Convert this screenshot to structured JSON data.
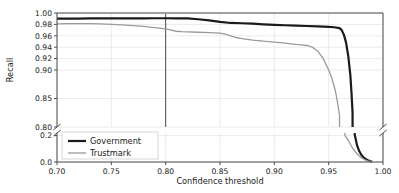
{
  "chart_data": {
    "type": "line",
    "title": "",
    "xlabel": "Confidence threshold",
    "ylabel": "Recall",
    "xlim": [
      0.7,
      1.0
    ],
    "xticks": [
      0.7,
      0.75,
      0.8,
      0.85,
      0.9,
      0.95,
      1.0
    ],
    "xticklabels": [
      "0.70",
      "0.75",
      "0.80",
      "0.85",
      "0.90",
      "0.95",
      "1.00"
    ],
    "yticklabels_upper": [
      "1.00",
      "0.98",
      "0.96",
      "0.94",
      "0.92",
      "0.90",
      "0.85",
      "0.80"
    ],
    "yticks_upper": [
      1.0,
      0.98,
      0.96,
      0.94,
      0.92,
      0.9,
      0.85,
      0.8
    ],
    "yticklabels_lower": [
      "0.2",
      "0.0"
    ],
    "yticks_lower": [
      0.2,
      0.0
    ],
    "broken_axis": true,
    "broken_axis_note": "y-axis broken between 0.80 and 0.2",
    "grid": true,
    "legend_position": "lower left",
    "annotation_vline_x": 0.8,
    "series": [
      {
        "name": "Government",
        "color": "#1a1a1a",
        "linewidth": 2.2,
        "x": [
          0.7,
          0.71,
          0.72,
          0.73,
          0.74,
          0.75,
          0.76,
          0.77,
          0.78,
          0.79,
          0.8,
          0.81,
          0.82,
          0.83,
          0.84,
          0.85,
          0.86,
          0.87,
          0.88,
          0.89,
          0.9,
          0.91,
          0.92,
          0.93,
          0.94,
          0.95,
          0.955,
          0.96,
          0.962,
          0.964,
          0.966,
          0.968,
          0.97,
          0.971,
          0.972,
          0.973,
          0.974,
          0.975,
          0.976,
          0.978,
          0.98,
          0.982,
          0.984,
          0.986,
          0.988,
          0.99
        ],
        "y": [
          0.99,
          0.9902,
          0.9903,
          0.9904,
          0.9905,
          0.9906,
          0.9906,
          0.9907,
          0.9907,
          0.9908,
          0.9908,
          0.9907,
          0.9905,
          0.989,
          0.987,
          0.9845,
          0.9825,
          0.982,
          0.9812,
          0.98,
          0.9792,
          0.9785,
          0.9778,
          0.9772,
          0.9765,
          0.9757,
          0.975,
          0.9735,
          0.97,
          0.962,
          0.948,
          0.925,
          0.89,
          0.86,
          0.825,
          0.785,
          0.205,
          0.17,
          0.13,
          0.085,
          0.055,
          0.036,
          0.023,
          0.014,
          0.007,
          0.002
        ]
      },
      {
        "name": "Trustmark",
        "color": "#9a9a9a",
        "linewidth": 1.3,
        "x": [
          0.7,
          0.71,
          0.72,
          0.73,
          0.74,
          0.75,
          0.76,
          0.77,
          0.78,
          0.79,
          0.8,
          0.805,
          0.81,
          0.815,
          0.82,
          0.83,
          0.84,
          0.85,
          0.855,
          0.86,
          0.865,
          0.87,
          0.88,
          0.89,
          0.9,
          0.905,
          0.91,
          0.915,
          0.92,
          0.925,
          0.93,
          0.935,
          0.94,
          0.945,
          0.95,
          0.953,
          0.956,
          0.958,
          0.96,
          0.962,
          0.965,
          0.968,
          0.97,
          0.972,
          0.975,
          0.978,
          0.98,
          0.982,
          0.984,
          0.986,
          0.988,
          0.99
        ],
        "y": [
          0.981,
          0.9812,
          0.9813,
          0.9812,
          0.9808,
          0.98,
          0.979,
          0.978,
          0.9765,
          0.9745,
          0.972,
          0.97,
          0.968,
          0.9672,
          0.9668,
          0.9662,
          0.9655,
          0.9648,
          0.963,
          0.96,
          0.957,
          0.955,
          0.9525,
          0.9505,
          0.949,
          0.948,
          0.947,
          0.946,
          0.9448,
          0.944,
          0.943,
          0.94,
          0.933,
          0.92,
          0.9,
          0.885,
          0.865,
          0.845,
          0.82,
          0.79,
          0.2,
          0.165,
          0.135,
          0.105,
          0.072,
          0.048,
          0.033,
          0.023,
          0.015,
          0.009,
          0.0045,
          0.0015
        ]
      }
    ],
    "legend_entries": [
      {
        "label": "Government",
        "color": "#1a1a1a",
        "linewidth": 2.2
      },
      {
        "label": "Trustmark",
        "color": "#9a9a9a",
        "linewidth": 1.3
      }
    ],
    "colors": {
      "government": "#1a1a1a",
      "trustmark": "#9a9a9a",
      "grid": "#e6e6e6",
      "axis": "#4d4d4d",
      "background": "#ffffff"
    }
  }
}
